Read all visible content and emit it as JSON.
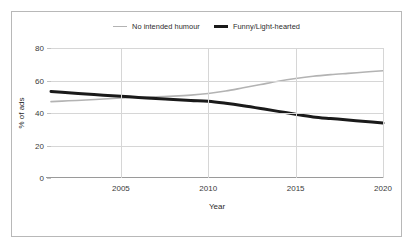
{
  "figure": {
    "border_color": "#b8b8b8",
    "background": "#ffffff"
  },
  "legend": {
    "position": "top-center",
    "entries": [
      {
        "label": "No intended humour",
        "color": "#b3b3b3",
        "width": "thin"
      },
      {
        "label": "Funny/Light-hearted",
        "color": "#1a1a1a",
        "width": "thick"
      }
    ]
  },
  "axes": {
    "x": {
      "title": "Year",
      "ticks": [
        2005,
        2010,
        2015,
        2020
      ],
      "tick_labels": [
        "2005",
        "2010",
        "2015",
        "2020"
      ],
      "min": 2001,
      "max": 2020,
      "grid": true
    },
    "y": {
      "title": "% of ads",
      "ticks": [
        0,
        20,
        40,
        60,
        80
      ],
      "tick_labels": [
        "0",
        "20",
        "40",
        "60",
        "80"
      ],
      "min": 0,
      "max": 80,
      "grid": true
    }
  },
  "chart_data": {
    "type": "line",
    "title": "",
    "xlabel": "Year",
    "ylabel": "% of ads",
    "xlim": [
      2001,
      2020
    ],
    "ylim": [
      0,
      80
    ],
    "grid": true,
    "legend_position": "top-center",
    "x": [
      2001,
      2002,
      2003,
      2004,
      2005,
      2006,
      2007,
      2008,
      2009,
      2010,
      2011,
      2012,
      2013,
      2014,
      2015,
      2016,
      2017,
      2018,
      2019,
      2020
    ],
    "series": [
      {
        "name": "No intended humour",
        "color": "#b3b3b3",
        "line_width": 1.6,
        "values": [
          47,
          47.5,
          48,
          48.6,
          49.2,
          49.6,
          50,
          50.4,
          51,
          52,
          53.5,
          55.5,
          57.5,
          59.5,
          61.2,
          62.6,
          63.6,
          64.4,
          65.2,
          66
        ]
      },
      {
        "name": "Funny/Light-hearted",
        "color": "#1a1a1a",
        "line_width": 3,
        "values": [
          53.3,
          52.5,
          51.7,
          51.0,
          50.3,
          49.6,
          48.9,
          48.3,
          47.7,
          47.2,
          46.0,
          44.5,
          42.8,
          41.0,
          39.2,
          37.6,
          36.6,
          35.7,
          34.8,
          33.8
        ]
      }
    ]
  }
}
